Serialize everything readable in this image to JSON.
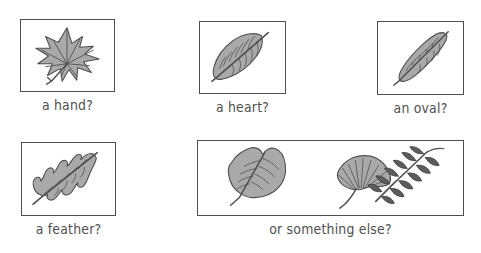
{
  "page": {
    "background_color": "#ffffff",
    "ink_color": "#4e4e4e",
    "fill_color": "#a9a9a9"
  },
  "cells": [
    {
      "id": "hand",
      "caption": "a hand?",
      "image_name": "maple-leaf-drawing",
      "image_alt": "palmate star-shaped maple leaf"
    },
    {
      "id": "heart",
      "caption": "a heart?",
      "image_name": "heart-shaped-leaf-drawing",
      "image_alt": "broad heart shaped leaf with serrated edge"
    },
    {
      "id": "oval",
      "caption": "an oval?",
      "image_name": "oval-leaf-drawing",
      "image_alt": "narrow elongated oval leaf"
    },
    {
      "id": "feather",
      "caption": "a feather?",
      "image_name": "oak-leaf-drawing",
      "image_alt": "lobed oak leaf resembling a feather"
    },
    {
      "id": "else",
      "caption": "or something else?",
      "image_name": "assorted-leaves-drawing",
      "image_alt": "three leaves: tulip-tree leaf, ginkgo leaf, and a compound leaf spray"
    }
  ]
}
